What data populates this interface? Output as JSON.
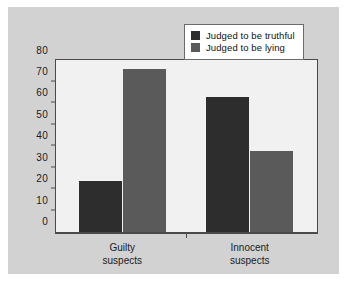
{
  "chart_data": {
    "type": "bar",
    "title": "",
    "xlabel": "",
    "ylabel": "",
    "categories": [
      "Guilty suspects",
      "Innocent suspects"
    ],
    "category_lines": [
      [
        "Guilty",
        "suspects"
      ],
      [
        "Innocent",
        "suspects"
      ]
    ],
    "series": [
      {
        "name": "Judged to be truthful",
        "values": [
          24,
          63
        ],
        "color": "#2d2d2d"
      },
      {
        "name": "Judged to be lying",
        "values": [
          76,
          38
        ],
        "color": "#5a5a5a"
      }
    ],
    "ylim": [
      0,
      80
    ],
    "yticks": [
      0,
      10,
      20,
      30,
      40,
      50,
      60,
      70,
      80
    ],
    "ytick_labels": [
      "0",
      "10",
      "20",
      "30",
      "40",
      "50",
      "60",
      "70",
      "80"
    ],
    "grid": false,
    "legend_position": "top-right"
  },
  "legend": {
    "entries": [
      {
        "label": "Judged to be truthful",
        "swatch": "#2d2d2d"
      },
      {
        "label": "Judged to be lying",
        "swatch": "#5a5a5a"
      }
    ]
  },
  "colors": {
    "page_background": "#ffffff",
    "panel_background": "#d2d2d2",
    "plot_background": "#f1f1f1",
    "axis": "#4a4a4a",
    "text": "#1a1a1a",
    "legend_background": "#ffffff",
    "legend_border": "#6b6b6b"
  }
}
